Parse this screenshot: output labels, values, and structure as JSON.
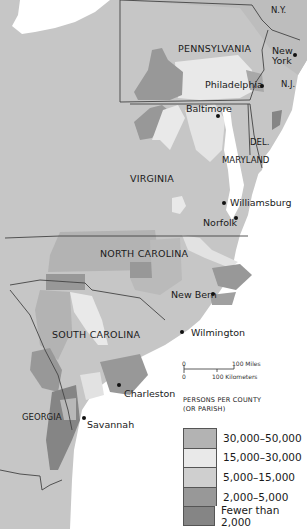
{
  "map": {
    "states": {
      "ny": "N.Y.",
      "pennsylvania": "PENNSYLVANIA",
      "nj": "N.J.",
      "delaware": "DEL.",
      "maryland": "MARYLAND",
      "virginia": "VIRGINIA",
      "north_carolina": "NORTH CAROLINA",
      "south_carolina": "SOUTH CAROLINA",
      "georgia": "GEORGIA"
    },
    "cities": {
      "new_york_1": "New",
      "new_york_2": "York",
      "philadelphia": "Philadelphia",
      "baltimore": "Baltimore",
      "williamsburg": "Williamsburg",
      "norfolk": "Norfolk",
      "new_bern": "New Bern",
      "wilmington": "Wilmington",
      "charleston": "Charleston",
      "savannah": "Savannah"
    },
    "scale": {
      "zero_miles": "0",
      "miles": "100 Miles",
      "zero_km": "0",
      "km": "100 Kilometers"
    },
    "colors": {
      "water": "#ffffff",
      "class_30k_50k": "#b3b3b3",
      "class_15k_30k": "#e9e9e9",
      "class_5k_15k": "#cfcfcf",
      "class_2k_5k": "#989898",
      "class_lt_2k": "#858585",
      "outside": "#c6c6c6",
      "border": "#444444"
    }
  },
  "legend": {
    "title_line1": "PERSONS PER COUNTY",
    "title_line2": "(OR PARISH)",
    "items": [
      {
        "label": "30,000–50,000",
        "color": "#b3b3b3"
      },
      {
        "label": "15,000–30,000",
        "color": "#e9e9e9"
      },
      {
        "label": "5,000–15,000",
        "color": "#cfcfcf"
      },
      {
        "label": "2,000–5,000",
        "color": "#989898"
      },
      {
        "label": "Fewer than 2,000",
        "color": "#858585"
      }
    ]
  }
}
